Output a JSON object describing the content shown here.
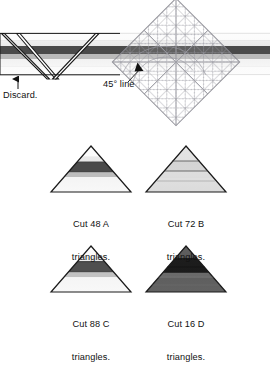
{
  "figure": {
    "annotations": {
      "discard": "Discard.",
      "angle": "45° line"
    }
  },
  "strip": {
    "name": "striped-fabric-strip",
    "bands": [
      {
        "name": "band-top-white",
        "color": "#fdfdfd",
        "height": 8
      },
      {
        "name": "band-light-gray",
        "color": "#efefef",
        "height": 6
      },
      {
        "name": "band-dark-gray",
        "color": "#4a4a4a",
        "height": 7
      },
      {
        "name": "band-mid-gray",
        "color": "#b9b9b9",
        "height": 5
      },
      {
        "name": "band-pale",
        "color": "#f4f4f4",
        "height": 8
      },
      {
        "name": "band-bottom-white",
        "color": "#fbfbfb",
        "height": 8
      }
    ],
    "top": 33,
    "left": 0,
    "right": 270
  },
  "ruler": {
    "name": "45-degree-ruler",
    "grid_color": "#9a9aa2",
    "outline_color": "#8b8b93",
    "rotation_deg": 45,
    "cells": 7
  },
  "triangles": [
    {
      "id": "A",
      "name": "triangle-a",
      "caption_line1": "Cut 48 A",
      "caption_line2": "triangles.",
      "count": 48,
      "letter": "A",
      "stripes": [
        {
          "color": "#fbfbfb",
          "stop": 0.0
        },
        {
          "color": "#fbfbfb",
          "stop": 0.22
        },
        {
          "color": "#e9e9e9",
          "stop": 0.34
        },
        {
          "color": "#4a4a4a",
          "stop": 0.55
        },
        {
          "color": "#bdbdbd",
          "stop": 0.66
        },
        {
          "color": "#f7f7f7",
          "stop": 1.0
        }
      ]
    },
    {
      "id": "B",
      "name": "triangle-b",
      "caption_line1": "Cut 72 B",
      "caption_line2": "triangles.",
      "count": 72,
      "letter": "B",
      "stripes": [
        {
          "color": "#e3e3e3",
          "stop": 0.0
        },
        {
          "color": "#dedede",
          "stop": 0.33
        },
        {
          "color": "#d7d7d7",
          "stop": 0.55
        },
        {
          "color": "#e0e0e0",
          "stop": 0.7
        },
        {
          "color": "#dcdcdc",
          "stop": 1.0
        }
      ]
    },
    {
      "id": "C",
      "name": "triangle-c",
      "caption_line1": "Cut 88 C",
      "caption_line2": "triangles.",
      "count": 88,
      "letter": "C",
      "stripes": [
        {
          "color": "#fcfcfc",
          "stop": 0.0
        },
        {
          "color": "#fcfcfc",
          "stop": 0.2
        },
        {
          "color": "#ececec",
          "stop": 0.32
        },
        {
          "color": "#4f4f4f",
          "stop": 0.56
        },
        {
          "color": "#c2c2c2",
          "stop": 0.68
        },
        {
          "color": "#f6f6f6",
          "stop": 1.0
        }
      ]
    },
    {
      "id": "D",
      "name": "triangle-d",
      "caption_line1": "Cut 16 D",
      "caption_line2": "triangles.",
      "count": 16,
      "letter": "D",
      "stripes": [
        {
          "color": "#5e5e5e",
          "stop": 0.0
        },
        {
          "color": "#5a5a5a",
          "stop": 0.26
        },
        {
          "color": "#1c1c1c",
          "stop": 0.42
        },
        {
          "color": "#1c1c1c",
          "stop": 0.58
        },
        {
          "color": "#6a6a6a",
          "stop": 0.7
        },
        {
          "color": "#636363",
          "stop": 1.0
        }
      ]
    }
  ],
  "colors": {
    "outline": "#1a1a1a",
    "grid": "#9a9aa2",
    "text": "#111111",
    "background": "#ffffff"
  }
}
